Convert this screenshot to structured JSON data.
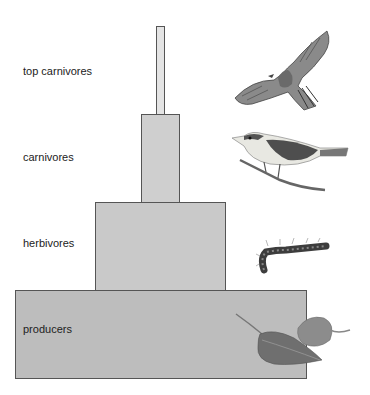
{
  "diagram": {
    "type": "pyramid-of-numbers",
    "levels": [
      {
        "label": "top carnivores",
        "organism": "hawk"
      },
      {
        "label": "carnivores",
        "organism": "songbird"
      },
      {
        "label": "herbivores",
        "organism": "caterpillar"
      },
      {
        "label": "producers",
        "organism": "leaves"
      }
    ]
  }
}
